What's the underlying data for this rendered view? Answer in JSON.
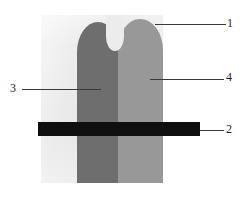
{
  "figure": {
    "type": "patent-line-drawing",
    "canvas": {
      "width": 242,
      "height": 197
    },
    "background_color": "#ffffff",
    "panel": {
      "name": "substrate-panel",
      "color": "#ececec"
    },
    "shapes": [
      {
        "id": "finger-left",
        "label": "left rounded column",
        "color": "#6e6e6e"
      },
      {
        "id": "finger-right",
        "label": "right rounded column",
        "color": "#989898"
      },
      {
        "id": "black-bar",
        "label": "horizontal black bar",
        "color": "#100f0f"
      }
    ],
    "callouts": [
      {
        "id": "callout-1",
        "numeral": "1",
        "points_to": "substrate-panel",
        "leader_side": "right"
      },
      {
        "id": "callout-2",
        "numeral": "2",
        "points_to": "black-bar",
        "leader_side": "right"
      },
      {
        "id": "callout-3",
        "numeral": "3",
        "points_to": "finger-left",
        "leader_side": "left"
      },
      {
        "id": "callout-4",
        "numeral": "4",
        "points_to": "finger-right",
        "leader_side": "right"
      }
    ]
  }
}
